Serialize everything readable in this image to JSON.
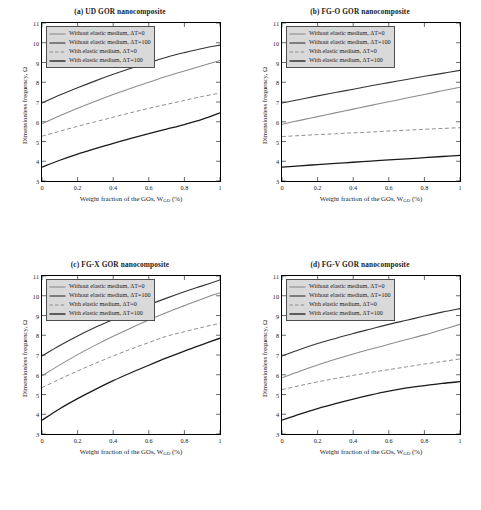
{
  "figure": {
    "background": "#ffffff",
    "width": 481,
    "height": 510
  },
  "axis": {
    "xlabel_pre": "Weight fraction of the GOs, W",
    "xlabel_sub": "GO",
    "xlabel_post": " (%)",
    "ylabel": "Dimensionless frequency, Ω",
    "xticks": [
      "0",
      "0.2",
      "0.4",
      "0.6",
      "0.8",
      "1"
    ],
    "yticks": [
      "3",
      "4",
      "5",
      "6",
      "7",
      "8",
      "9",
      "10",
      "11"
    ],
    "xlim": [
      0,
      1
    ],
    "ylim": [
      3,
      11
    ]
  },
  "legend": {
    "position": "upper-left",
    "background": "#d9d9d9",
    "border": "#4d4d4d",
    "entries": [
      {
        "label": "Without elastic medium, ΔT=0",
        "style": "solid",
        "color": "#8c8c8c",
        "width": 1.1
      },
      {
        "label": "Without elastic medium, ΔT=100",
        "style": "solid",
        "color": "#333333",
        "width": 1.1
      },
      {
        "label": "With elastic medium, ΔT=0",
        "style": "dashed",
        "color": "#8c8c8c",
        "width": 1.0
      },
      {
        "label": "With elastic medium, ΔT=100",
        "style": "solid",
        "color": "#1a1a1a",
        "width": 1.3
      }
    ]
  },
  "chart_data": [
    {
      "type": "line",
      "panel": "a",
      "title": "(a) UD GOR nanocomposite",
      "xlabel": "Weight fraction of the GOs, W_GO (%)",
      "ylabel": "Dimensionless frequency, Ω",
      "xlim": [
        0,
        1
      ],
      "ylim": [
        3,
        11
      ],
      "grid": false,
      "x": [
        0,
        0.1,
        0.2,
        0.3,
        0.4,
        0.5,
        0.6,
        0.7,
        0.8,
        0.9,
        1
      ],
      "series": [
        {
          "name": "Without elastic medium, ΔT=100",
          "color": "#333333",
          "style": "solid",
          "values": [
            6.95,
            7.35,
            7.72,
            8.07,
            8.4,
            8.71,
            9.0,
            9.27,
            9.5,
            9.71,
            9.88
          ]
        },
        {
          "name": "Without elastic medium, ΔT=0",
          "color": "#8c8c8c",
          "style": "solid",
          "values": [
            5.9,
            6.3,
            6.68,
            7.04,
            7.38,
            7.7,
            8.0,
            8.3,
            8.57,
            8.84,
            9.1
          ]
        },
        {
          "name": "With elastic medium, ΔT=0",
          "color": "#8c8c8c",
          "style": "dashed",
          "values": [
            5.27,
            5.52,
            5.77,
            6.0,
            6.23,
            6.46,
            6.68,
            6.88,
            7.08,
            7.28,
            7.45
          ]
        },
        {
          "name": "With elastic medium, ΔT=100",
          "color": "#1a1a1a",
          "style": "solid",
          "values": [
            3.7,
            4.05,
            4.36,
            4.64,
            4.91,
            5.16,
            5.4,
            5.63,
            5.86,
            6.12,
            6.45
          ]
        }
      ]
    },
    {
      "type": "line",
      "panel": "b",
      "title": "(b) FG-O GOR nanocomposite",
      "xlabel": "Weight fraction of the GOs, W_GO (%)",
      "ylabel": "Dimensionless frequency, Ω",
      "xlim": [
        0,
        1
      ],
      "ylim": [
        3,
        11
      ],
      "grid": false,
      "x": [
        0,
        0.1,
        0.2,
        0.3,
        0.4,
        0.5,
        0.6,
        0.7,
        0.8,
        0.9,
        1
      ],
      "series": [
        {
          "name": "Without elastic medium, ΔT=100",
          "color": "#333333",
          "style": "solid",
          "values": [
            6.95,
            7.13,
            7.31,
            7.48,
            7.65,
            7.82,
            7.98,
            8.14,
            8.3,
            8.45,
            8.6
          ]
        },
        {
          "name": "Without elastic medium, ΔT=0",
          "color": "#8c8c8c",
          "style": "solid",
          "values": [
            5.87,
            6.07,
            6.26,
            6.45,
            6.64,
            6.83,
            7.01,
            7.2,
            7.38,
            7.57,
            7.75
          ]
        },
        {
          "name": "With elastic medium, ΔT=0",
          "color": "#8c8c8c",
          "style": "dashed",
          "values": [
            5.25,
            5.3,
            5.35,
            5.39,
            5.44,
            5.48,
            5.53,
            5.57,
            5.62,
            5.66,
            5.7
          ]
        },
        {
          "name": "With elastic medium, ΔT=100",
          "color": "#1a1a1a",
          "style": "solid",
          "values": [
            3.7,
            3.77,
            3.83,
            3.89,
            3.95,
            4.01,
            4.07,
            4.12,
            4.18,
            4.24,
            4.3
          ]
        }
      ]
    },
    {
      "type": "line",
      "panel": "c",
      "title": "(c) FG-X GOR nanocomposite",
      "xlabel": "Weight fraction of the GOs, W_GO (%)",
      "ylabel": "Dimensionless frequency, Ω",
      "xlim": [
        0,
        1
      ],
      "ylim": [
        3,
        11
      ],
      "grid": false,
      "x": [
        0,
        0.1,
        0.2,
        0.3,
        0.4,
        0.5,
        0.6,
        0.7,
        0.8,
        0.9,
        1
      ],
      "series": [
        {
          "name": "Without elastic medium, ΔT=100",
          "color": "#333333",
          "style": "solid",
          "values": [
            6.95,
            7.48,
            7.96,
            8.4,
            8.8,
            9.18,
            9.54,
            9.88,
            10.2,
            10.5,
            10.8
          ]
        },
        {
          "name": "Without elastic medium, ΔT=0",
          "color": "#8c8c8c",
          "style": "solid",
          "values": [
            5.95,
            6.5,
            7.02,
            7.5,
            7.95,
            8.37,
            8.77,
            9.15,
            9.5,
            9.84,
            10.15
          ]
        },
        {
          "name": "With elastic medium, ΔT=0",
          "color": "#8c8c8c",
          "style": "dashed",
          "values": [
            5.35,
            5.78,
            6.19,
            6.58,
            6.95,
            7.3,
            7.63,
            7.95,
            8.18,
            8.4,
            8.6
          ]
        },
        {
          "name": "With elastic medium, ΔT=100",
          "color": "#1a1a1a",
          "style": "solid",
          "values": [
            3.7,
            4.28,
            4.79,
            5.26,
            5.7,
            6.1,
            6.48,
            6.85,
            7.2,
            7.53,
            7.85
          ]
        }
      ]
    },
    {
      "type": "line",
      "panel": "d",
      "title": "(d) FG-V GOR nanocomposite",
      "xlabel": "Weight fraction of the GOs, W_GO (%)",
      "ylabel": "Dimensionless frequency, Ω",
      "xlim": [
        0,
        1
      ],
      "ylim": [
        3,
        11
      ],
      "grid": false,
      "x": [
        0,
        0.1,
        0.2,
        0.3,
        0.4,
        0.5,
        0.6,
        0.7,
        0.8,
        0.9,
        1
      ],
      "series": [
        {
          "name": "Without elastic medium, ΔT=100",
          "color": "#333333",
          "style": "solid",
          "values": [
            6.95,
            7.28,
            7.58,
            7.84,
            8.09,
            8.32,
            8.55,
            8.76,
            8.97,
            9.17,
            9.35
          ]
        },
        {
          "name": "Without elastic medium, ΔT=0",
          "color": "#8c8c8c",
          "style": "solid",
          "values": [
            5.85,
            6.18,
            6.49,
            6.78,
            7.05,
            7.3,
            7.54,
            7.78,
            8.02,
            8.28,
            8.55
          ]
        },
        {
          "name": "With elastic medium, ΔT=0",
          "color": "#8c8c8c",
          "style": "dashed",
          "values": [
            5.25,
            5.45,
            5.64,
            5.81,
            5.97,
            6.12,
            6.26,
            6.4,
            6.54,
            6.67,
            6.8
          ]
        },
        {
          "name": "With elastic medium, ΔT=100",
          "color": "#1a1a1a",
          "style": "solid",
          "values": [
            3.7,
            4.01,
            4.29,
            4.54,
            4.77,
            4.98,
            5.17,
            5.33,
            5.45,
            5.56,
            5.65
          ]
        }
      ]
    }
  ]
}
